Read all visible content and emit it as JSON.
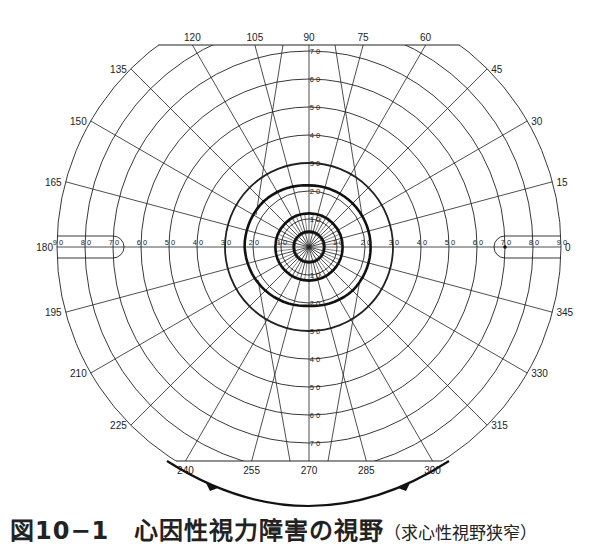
{
  "figure": {
    "caption_main": "図10−1　心因性視力障害の視野",
    "caption_sub": "（求心性視野狭窄）"
  },
  "chart_data": {
    "type": "polar-perimetry",
    "title": "心因性視力障害の視野（求心性視野狭窄）",
    "center_px": [
      309,
      247
    ],
    "px_per_degree": 2.8,
    "eccentricity_rings_deg": [
      10,
      20,
      30,
      40,
      50,
      60,
      70,
      80,
      90
    ],
    "eccentricity_labels": [
      "10",
      "20",
      "30",
      "40",
      "50",
      "60",
      "70",
      "80",
      "90"
    ],
    "meridian_step_deg": 15,
    "meridian_labels": [
      "0",
      "15",
      "30",
      "45",
      "60",
      "75",
      "90",
      "105",
      "120",
      "135",
      "150",
      "165",
      "180",
      "195",
      "210",
      "225",
      "240",
      "255",
      "270",
      "285",
      "300",
      "315",
      "330",
      "345"
    ],
    "clip_top_y": 45,
    "clip_bottom_y": 461,
    "isopters": [
      {
        "name": "outer isopter",
        "style": "thick",
        "radii_deg_by_meridian": {
          "0": 22,
          "45": 22,
          "90": 22,
          "135": 23,
          "180": 23,
          "225": 22,
          "270": 21,
          "315": 22
        }
      },
      {
        "name": "middle isopter",
        "style": "thick",
        "radius_deg": 12
      },
      {
        "name": "inner isopter",
        "style": "thick",
        "radius_deg": 5.5
      }
    ],
    "emphasized_ring_deg": 30,
    "blind_spot_markers": [
      {
        "side": "left",
        "from_deg": 70,
        "to_deg": 90
      },
      {
        "side": "right",
        "from_deg": 70,
        "to_deg": 90
      }
    ],
    "bottom_arc_annotation": "arrows pointing inward (240° → 300°)"
  }
}
